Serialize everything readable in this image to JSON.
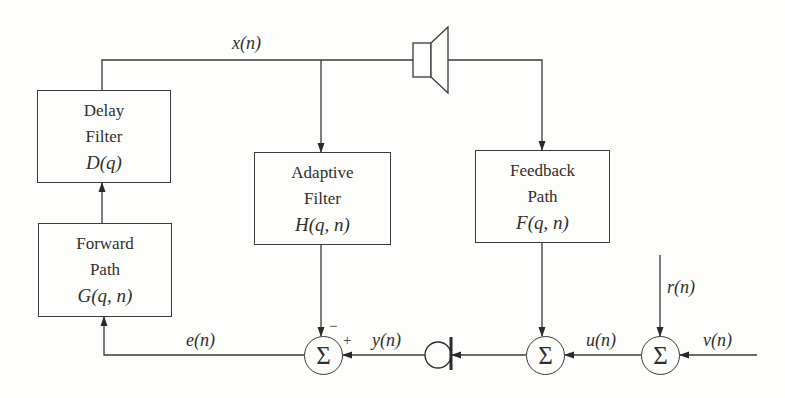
{
  "diagram": {
    "type": "block-diagram",
    "blocks": [
      {
        "id": "delay",
        "line1": "Delay",
        "line2": "Filter",
        "math": "D(q)"
      },
      {
        "id": "forward",
        "line1": "Forward",
        "line2": "Path",
        "math": "G(q, n)"
      },
      {
        "id": "adaptive",
        "line1": "Adaptive",
        "line2": "Filter",
        "math": "H(q, n)"
      },
      {
        "id": "feedback",
        "line1": "Feedback",
        "line2": "Path",
        "math": "F(q, n)"
      }
    ],
    "signals": {
      "x": "x(n)",
      "e": "e(n)",
      "y": "y(n)",
      "u": "u(n)",
      "r": "r(n)",
      "v": "v(n)"
    },
    "summing_junctions": [
      {
        "id": "sum1",
        "symbol": "Σ",
        "minus_sign": "−",
        "plus_sign": "+"
      },
      {
        "id": "sum2",
        "symbol": "Σ"
      },
      {
        "id": "sum3",
        "symbol": "Σ"
      }
    ],
    "devices": {
      "loudspeaker": "loudspeaker-icon",
      "microphone": "microphone-icon"
    },
    "colors": {
      "line": "#3a3a3a",
      "background": "#fdfdfb",
      "text": "#2f2f2f"
    }
  }
}
